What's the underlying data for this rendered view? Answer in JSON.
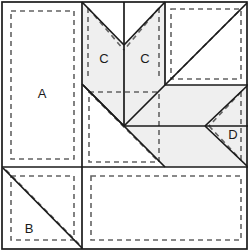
{
  "diagram": {
    "width": 248,
    "height": 251,
    "colors": {
      "background": "#ffffff",
      "shaded_fill": "#efefef",
      "plain_fill": "#fdfdfd",
      "solid_line": "#1a1a1a",
      "dashed_line": "#636363",
      "label_text": "#1a1a1a"
    },
    "labels": [
      {
        "id": "A",
        "text": "A",
        "x": 42,
        "y": 95
      },
      {
        "id": "C-left",
        "text": "C",
        "x": 104,
        "y": 60
      },
      {
        "id": "C-right",
        "text": "C",
        "x": 145,
        "y": 60
      },
      {
        "id": "D",
        "text": "D",
        "x": 233,
        "y": 136
      },
      {
        "id": "B",
        "text": "B",
        "x": 29,
        "y": 230
      }
    ],
    "units": [
      {
        "id": "unit-a",
        "label": "A",
        "kind": "rectangle",
        "shaded": false,
        "seam_outline": true,
        "bounds": {
          "x": 2,
          "y": 2,
          "width": 80,
          "height": 165
        }
      },
      {
        "id": "unit-b",
        "label": "B",
        "kind": "half-square-triangle",
        "shaded": false,
        "seam_outline": true,
        "bounds": {
          "x": 2,
          "y": 167,
          "width": 80,
          "height": 82
        }
      },
      {
        "id": "unit-c-left",
        "label": "C",
        "kind": "chevron-half",
        "shaded": true,
        "seam_outline": true,
        "bounds": {
          "x": 82,
          "y": 2,
          "width": 42,
          "height": 124
        }
      },
      {
        "id": "unit-c-right",
        "label": "C",
        "kind": "chevron-half",
        "shaded": true,
        "seam_outline": true,
        "bounds": {
          "x": 124,
          "y": 2,
          "width": 41,
          "height": 124
        }
      },
      {
        "id": "unit-d",
        "label": "D",
        "kind": "flying-geese-point",
        "shaded": false,
        "seam_outline": true,
        "bounds": {
          "x": 205,
          "y": 85,
          "width": 43,
          "height": 82
        }
      },
      {
        "id": "unit-top-right",
        "label": "",
        "kind": "half-square-triangle",
        "shaded": false,
        "seam_outline": true,
        "bounds": {
          "x": 165,
          "y": 2,
          "width": 82,
          "height": 83
        }
      },
      {
        "id": "unit-center-left",
        "label": "",
        "kind": "half-square-triangle",
        "shaded": false,
        "seam_outline": true,
        "bounds": {
          "x": 82,
          "y": 85,
          "width": 82,
          "height": 82
        }
      },
      {
        "id": "unit-bottom-right",
        "label": "",
        "kind": "rectangle",
        "shaded": false,
        "seam_outline": true,
        "bounds": {
          "x": 84,
          "y": 169,
          "width": 163,
          "height": 80
        }
      }
    ],
    "shaded_regions": [
      {
        "id": "shaded-chevron-left",
        "points": "82,2 124,45 124,126 82,84"
      },
      {
        "id": "shaded-chevron-right",
        "points": "165,2 165,84 124,126 124,45"
      },
      {
        "id": "shaded-right-band",
        "points": "165,85 248,85 248,167 165,167 124,126"
      }
    ],
    "solid_lines": [
      {
        "id": "outer-border",
        "kind": "rect",
        "x": 2,
        "y": 2,
        "width": 245,
        "height": 247
      },
      {
        "id": "divider-vertical-left",
        "kind": "line",
        "x1": 82,
        "y1": 2,
        "x2": 82,
        "y2": 167
      },
      {
        "id": "divider-vertical-center",
        "kind": "line",
        "x1": 124,
        "y1": 2,
        "x2": 124,
        "y2": 126
      },
      {
        "id": "divider-vertical-right",
        "kind": "line",
        "x1": 165,
        "y1": 2,
        "x2": 165,
        "y2": 85
      },
      {
        "id": "divider-horizontal-lower",
        "kind": "line",
        "x1": 2,
        "y1": 167,
        "x2": 248,
        "y2": 167
      },
      {
        "id": "divider-horizontal-right",
        "kind": "line",
        "x1": 165,
        "y1": 85,
        "x2": 248,
        "y2": 85
      },
      {
        "id": "divider-horizontal-mid",
        "kind": "line",
        "x1": 124,
        "y1": 126,
        "x2": 248,
        "y2": 126
      },
      {
        "id": "divider-vertical-bottom",
        "kind": "line",
        "x1": 82,
        "y1": 167,
        "x2": 82,
        "y2": 249
      },
      {
        "id": "chevron-left-stroke",
        "kind": "line",
        "x1": 82,
        "y1": 2,
        "x2": 124,
        "y2": 45
      },
      {
        "id": "chevron-right-stroke",
        "kind": "line",
        "x1": 165,
        "y1": 2,
        "x2": 124,
        "y2": 45
      },
      {
        "id": "chevron-left-lower",
        "kind": "line",
        "x1": 82,
        "y1": 84,
        "x2": 124,
        "y2": 126
      },
      {
        "id": "chevron-right-lower",
        "kind": "line",
        "x1": 165,
        "y1": 85,
        "x2": 124,
        "y2": 126
      },
      {
        "id": "hst-top-right-diagonal",
        "kind": "line",
        "x1": 165,
        "y1": 85,
        "x2": 247,
        "y2": 3
      },
      {
        "id": "hst-center-diagonal",
        "kind": "line",
        "x1": 83,
        "y1": 85,
        "x2": 165,
        "y2": 167
      },
      {
        "id": "hst-b-diagonal",
        "kind": "line",
        "x1": 3,
        "y1": 168,
        "x2": 82,
        "y2": 248
      },
      {
        "id": "geese-upper",
        "kind": "line",
        "x1": 247,
        "y1": 86,
        "x2": 205,
        "y2": 126
      },
      {
        "id": "geese-lower",
        "kind": "line",
        "x1": 205,
        "y1": 126,
        "x2": 247,
        "y2": 166
      }
    ],
    "dashed_lines": [
      {
        "id": "seam-a",
        "kind": "rect",
        "x": 11,
        "y": 11,
        "width": 63,
        "height": 148
      },
      {
        "id": "seam-b",
        "kind": "rect",
        "x": 11,
        "y": 176,
        "width": 63,
        "height": 64
      },
      {
        "id": "seam-b-diagonal",
        "kind": "line",
        "x1": 6,
        "y1": 170,
        "x2": 79,
        "y2": 244
      },
      {
        "id": "seam-c-left",
        "kind": "line",
        "x1": 88,
        "y1": 8,
        "x2": 124,
        "y2": 50
      },
      {
        "id": "seam-c-left-vert",
        "kind": "line",
        "x1": 88,
        "y1": 8,
        "x2": 88,
        "y2": 78
      },
      {
        "id": "seam-c-right",
        "kind": "line",
        "x1": 159,
        "y1": 8,
        "x2": 124,
        "y2": 50
      },
      {
        "id": "seam-c-right-vert",
        "kind": "line",
        "x1": 159,
        "y1": 8,
        "x2": 159,
        "y2": 79
      },
      {
        "id": "seam-top-right",
        "kind": "rect",
        "x": 171,
        "y": 9,
        "width": 70,
        "height": 70
      },
      {
        "id": "seam-top-right-diagonal",
        "kind": "line",
        "x1": 171,
        "y1": 79,
        "x2": 241,
        "y2": 9
      },
      {
        "id": "seam-center",
        "kind": "rect",
        "x": 89,
        "y": 92,
        "width": 70,
        "height": 70
      },
      {
        "id": "seam-center-diagonal",
        "kind": "line",
        "x1": 89,
        "y1": 92,
        "x2": 159,
        "y2": 162
      },
      {
        "id": "seam-d-vert",
        "kind": "line",
        "x1": 241,
        "y1": 92,
        "x2": 241,
        "y2": 160
      },
      {
        "id": "seam-d-upper",
        "kind": "line",
        "x1": 241,
        "y1": 92,
        "x2": 209,
        "y2": 126
      },
      {
        "id": "seam-d-lower",
        "kind": "line",
        "x1": 209,
        "y1": 126,
        "x2": 241,
        "y2": 160
      },
      {
        "id": "seam-bottom-right",
        "kind": "rect",
        "x": 91,
        "y": 176,
        "width": 150,
        "height": 64
      }
    ]
  }
}
